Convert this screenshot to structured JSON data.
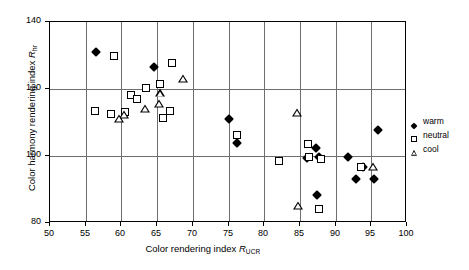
{
  "chart_data": {
    "type": "scatter",
    "title": "",
    "xlabel": "Color rendering index R_UCR",
    "ylabel": "Color harmony rendering index R_hr",
    "xlim": [
      50,
      100
    ],
    "ylim": [
      80,
      140
    ],
    "xticks": [
      50,
      55,
      60,
      65,
      70,
      75,
      80,
      85,
      90,
      95,
      100
    ],
    "yticks": [
      80,
      100,
      120,
      140
    ],
    "grid": true,
    "legend_position": "right",
    "series": [
      {
        "name": "warm",
        "marker": "filled-diamond",
        "color": "#000000",
        "points": [
          [
            56.5,
            131.0
          ],
          [
            64.6,
            126.5
          ],
          [
            75.0,
            111.2
          ],
          [
            76.2,
            103.8
          ],
          [
            86.0,
            99.5
          ],
          [
            87.3,
            102.5
          ],
          [
            87.6,
            99.6
          ],
          [
            87.4,
            88.3
          ],
          [
            91.7,
            99.6
          ],
          [
            93.8,
            96.8
          ],
          [
            92.9,
            93.1
          ],
          [
            95.4,
            93.0
          ],
          [
            95.9,
            107.9
          ]
        ]
      },
      {
        "name": "neutral",
        "marker": "open-square",
        "color": "#000000",
        "points": [
          [
            58.9,
            130.0
          ],
          [
            56.3,
            113.5
          ],
          [
            58.5,
            112.6
          ],
          [
            60.5,
            113.0
          ],
          [
            61.3,
            118.3
          ],
          [
            62.2,
            117.0
          ],
          [
            63.4,
            120.4
          ],
          [
            65.4,
            121.4
          ],
          [
            67.1,
            127.8
          ],
          [
            65.8,
            111.4
          ],
          [
            66.8,
            113.4
          ],
          [
            76.2,
            106.4
          ],
          [
            82.0,
            98.5
          ],
          [
            86.1,
            103.6
          ],
          [
            86.2,
            99.8
          ],
          [
            87.9,
            99.2
          ],
          [
            87.6,
            84.2
          ],
          [
            93.6,
            96.8
          ]
        ]
      },
      {
        "name": "cool",
        "marker": "open-triangle",
        "color": "#000000",
        "points": [
          [
            60.4,
            112.3
          ],
          [
            59.7,
            111.2
          ],
          [
            63.3,
            114.0
          ],
          [
            65.4,
            118.7
          ],
          [
            65.3,
            115.5
          ],
          [
            68.6,
            123.0
          ],
          [
            84.6,
            112.9
          ],
          [
            84.7,
            85.2
          ],
          [
            95.3,
            96.7
          ]
        ]
      }
    ]
  },
  "axis": {
    "x_title_main": "Color rendering index ",
    "x_title_symbol": "R",
    "x_title_sub": "UCR",
    "y_title_main": "Color harmony rendering index ",
    "y_title_symbol": "R",
    "y_title_sub": "hr",
    "xticklabels": [
      "50",
      "55",
      "60",
      "65",
      "70",
      "75",
      "80",
      "85",
      "90",
      "95",
      "100"
    ],
    "yticklabels": [
      "140",
      "120",
      "100",
      "80"
    ]
  },
  "legend": {
    "items": [
      {
        "label": "warm",
        "marker": "filled-diamond"
      },
      {
        "label": "neutral",
        "marker": "open-square"
      },
      {
        "label": "cool",
        "marker": "open-triangle"
      }
    ]
  }
}
